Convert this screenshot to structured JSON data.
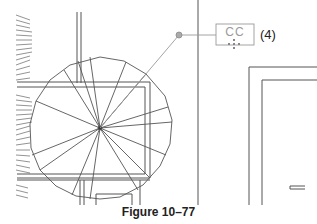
{
  "figure": {
    "caption": "Figure 10–77",
    "callout": {
      "tag_text": "CC",
      "label": "(4)"
    }
  },
  "drawing": {
    "stair_center": [
      100,
      128
    ],
    "stair_radius": 70,
    "line_color": "#555555",
    "callout_color": "#9a9a9a"
  }
}
